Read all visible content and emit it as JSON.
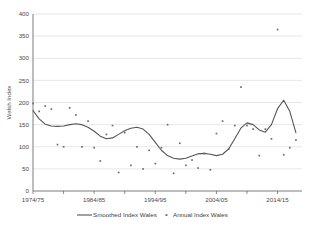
{
  "chart_data": {
    "type": "line",
    "title": "",
    "xlabel": "",
    "ylabel": "Welsh Index",
    "ylim": [
      0,
      400
    ],
    "yticks": [
      0,
      50,
      100,
      150,
      200,
      250,
      300,
      350,
      400
    ],
    "ytick_labels": [
      "0",
      "50",
      "100",
      "150",
      "200",
      "250",
      "300",
      "350",
      "400"
    ],
    "xlim": [
      1974,
      2018
    ],
    "xtick_labels": [
      "1974/75",
      "1984/85",
      "1994/95",
      "2004/05",
      "2014/15"
    ],
    "xtick_values": [
      1974,
      1984,
      1994,
      2004,
      2014
    ],
    "xminor_values": [
      1979,
      1989,
      1999,
      2009
    ],
    "grid": true,
    "legend_position": "bottom",
    "series": [
      {
        "name": "Smoothed Index Wales",
        "marker": "line",
        "color": "#555555",
        "x": [
          1974,
          1975,
          1976,
          1977,
          1978,
          1979,
          1980,
          1981,
          1982,
          1983,
          1984,
          1985,
          1986,
          1987,
          1988,
          1989,
          1990,
          1991,
          1992,
          1993,
          1994,
          1995,
          1996,
          1997,
          1998,
          1999,
          2000,
          2001,
          2002,
          2003,
          2004,
          2005,
          2006,
          2007,
          2008,
          2009,
          2010,
          2011,
          2012,
          2013,
          2014,
          2015,
          2016,
          2017
        ],
        "values": [
          182,
          163,
          151,
          147,
          146,
          147,
          150,
          152,
          150,
          144,
          135,
          124,
          118,
          120,
          128,
          136,
          142,
          144,
          140,
          128,
          110,
          92,
          80,
          74,
          72,
          74,
          79,
          84,
          85,
          83,
          80,
          83,
          95,
          118,
          142,
          154,
          150,
          138,
          133,
          150,
          186,
          205,
          180,
          132
        ]
      },
      {
        "name": "Annual Index Wales",
        "marker": "point",
        "color": "#6e6e6e",
        "x": [
          1974,
          1975,
          1976,
          1977,
          1978,
          1979,
          1980,
          1981,
          1982,
          1983,
          1984,
          1985,
          1986,
          1987,
          1988,
          1989,
          1990,
          1991,
          1992,
          1993,
          1994,
          1995,
          1996,
          1997,
          1998,
          1999,
          2000,
          2001,
          2002,
          2003,
          2004,
          2005,
          2006,
          2007,
          2008,
          2009,
          2010,
          2011,
          2012,
          2013,
          2014,
          2015,
          2016,
          2017
        ],
        "values": [
          198,
          180,
          192,
          185,
          105,
          100,
          188,
          172,
          100,
          158,
          98,
          68,
          128,
          148,
          42,
          132,
          58,
          100,
          50,
          92,
          62,
          98,
          150,
          40,
          108,
          58,
          70,
          52,
          85,
          48,
          130,
          158,
          95,
          148,
          235,
          148,
          140,
          80,
          140,
          118,
          365,
          82,
          98,
          115
        ]
      }
    ]
  },
  "legend": {
    "items": [
      {
        "label": "Smoothed Index Wales",
        "type": "line"
      },
      {
        "label": "Annual Index Wales",
        "type": "point"
      }
    ]
  }
}
